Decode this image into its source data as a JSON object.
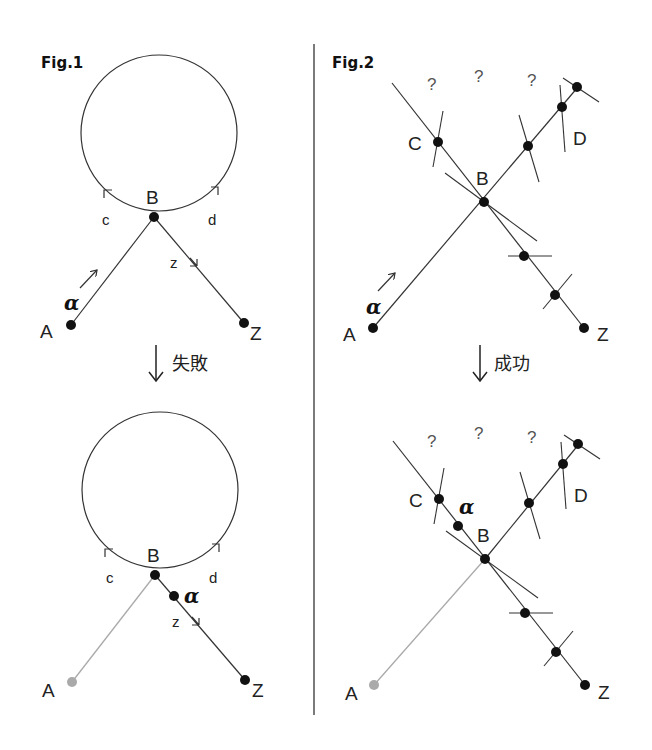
{
  "figures": {
    "fig1": {
      "title": "Fig.1",
      "labels": {
        "A": "A",
        "B": "B",
        "Z": "Z",
        "c": "c",
        "d": "d",
        "z": "z",
        "alpha": "α"
      },
      "transition": {
        "arrow": "↓",
        "label": "失敗"
      }
    },
    "fig2": {
      "title": "Fig.2",
      "labels": {
        "A": "A",
        "B": "B",
        "C": "C",
        "D": "D",
        "Z": "Z",
        "alpha": "α",
        "question": "?"
      },
      "transition": {
        "arrow": "↓",
        "label": "成功"
      }
    }
  },
  "colors": {
    "ink": "#111111",
    "line": "#333333",
    "faded": "#aaaaaa",
    "background": "#ffffff"
  }
}
